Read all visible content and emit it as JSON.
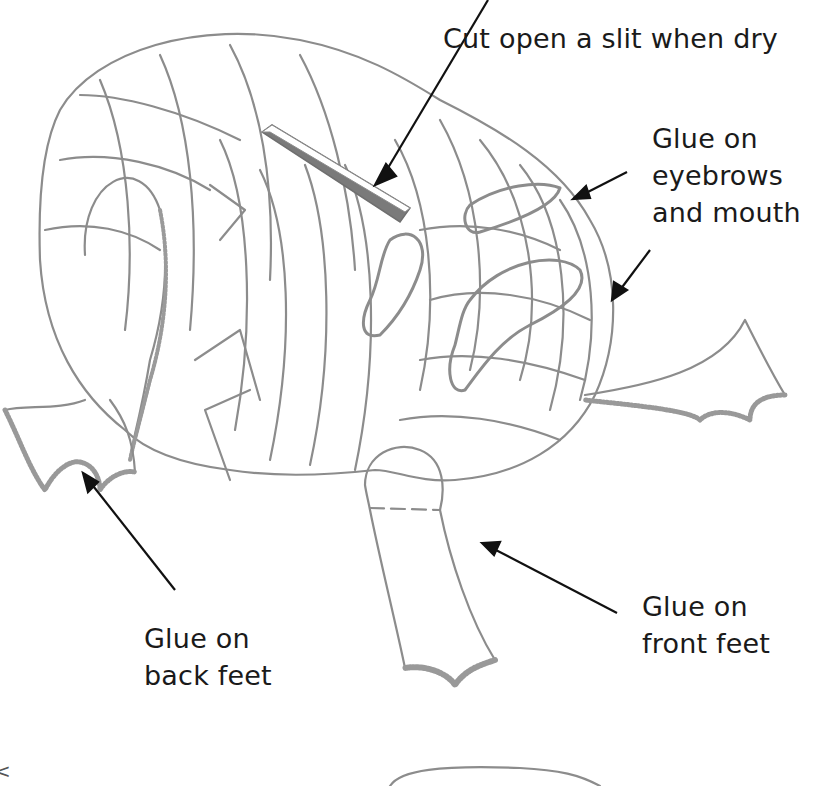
{
  "diagram": {
    "colors": {
      "outline": "#8c8c8c",
      "slit_fill": "#7a7a7a",
      "arrow": "#111111",
      "text": "#1a1a1a",
      "background": "#ffffff"
    },
    "labels": {
      "slit": {
        "lines": [
          "Cut open a slit when dry"
        ]
      },
      "face": {
        "lines": [
          "Glue on",
          "eyebrows",
          "and mouth"
        ]
      },
      "back_feet": {
        "lines": [
          "Glue on",
          "back feet"
        ]
      },
      "front_feet": {
        "lines": [
          "Glue on",
          "front feet"
        ]
      }
    },
    "edge_mark": "<"
  }
}
